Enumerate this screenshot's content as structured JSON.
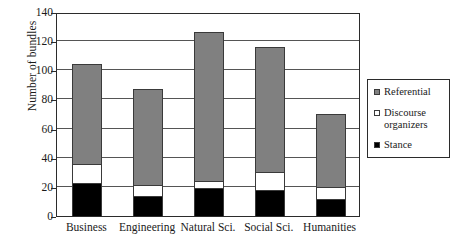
{
  "chart_data": {
    "type": "bar",
    "subtype": "stacked-bar",
    "title": "",
    "xlabel": "",
    "ylabel": "Number of bundles",
    "ylim": [
      0,
      140
    ],
    "yticks": [
      0,
      20,
      40,
      60,
      80,
      100,
      120,
      140
    ],
    "ytick_labels": [
      "0",
      "20",
      "40",
      "60",
      "80",
      "100",
      "120",
      "140"
    ],
    "grid": true,
    "grid_axis": "y",
    "legend_position": "right",
    "categories": [
      "Business",
      "Engineering",
      "Natural Sci.",
      "Social Sci.",
      "Humanities"
    ],
    "series": [
      {
        "name": "Stance",
        "color": "#000000",
        "swatch": "filled-black-square",
        "values": [
          23,
          14,
          19,
          18,
          12
        ]
      },
      {
        "name": "Discourse organizers",
        "color": "#ffffff",
        "swatch": "empty-white-square",
        "values": [
          13,
          7,
          5,
          12,
          8
        ]
      },
      {
        "name": "Referential",
        "color": "#808080",
        "swatch": "filled-gray-square",
        "values": [
          68,
          66,
          102,
          86,
          50
        ]
      }
    ],
    "totals": [
      104,
      87,
      126,
      116,
      70
    ]
  },
  "legend": {
    "entries": [
      {
        "label": "Referential"
      },
      {
        "label": "Discourse organizers"
      },
      {
        "label": "Stance"
      }
    ]
  }
}
